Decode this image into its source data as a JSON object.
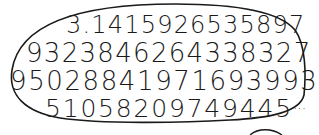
{
  "illustration": {
    "subject": "digits of pi",
    "lines": [
      "3.1415926535897",
      "9323846264338327",
      "9502884197169399 37",
      "51058209749445"
    ],
    "line_1": "3.1415926535897",
    "line_2": "9323846264338327",
    "line_3": "950288419716939937",
    "line_4": "51058209749445",
    "ellipsis": "...",
    "ink_color": "#1a1a1a",
    "background_color": "#ffffff"
  }
}
